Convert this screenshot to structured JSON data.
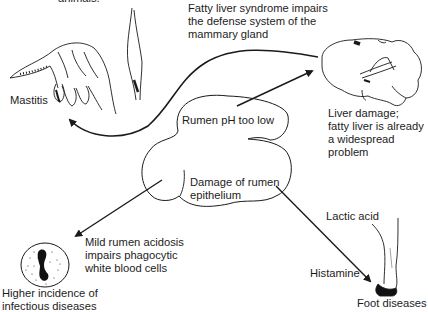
{
  "diagram": {
    "type": "flow",
    "colors": {
      "ink": "#1a1a1a",
      "background": "#ffffff"
    },
    "top_clipped_text": "animals.",
    "nodes": {
      "center": {
        "line1": "Rumen pH too low",
        "line2": "Damage of rumen\nepithelium"
      },
      "mastitis": {
        "label": "Mastitis",
        "icon": "cow-udder-icon"
      },
      "fatty_liver_note": "Fatty liver syndrome impairs\nthe defense system of the\nmammary gland",
      "liver": {
        "label": "Liver damage;\nfatty liver is already\na widespread problem",
        "icon": "liver-icon"
      },
      "infection": {
        "note": "Mild rumen acidosis\nimpairs phagocytic\nwhite blood cells",
        "label": "Higher incidence of\ninfectious diseases",
        "icon": "white-blood-cell-icon"
      },
      "foot": {
        "lactic": "Lactic acid",
        "histamine": "Histamine",
        "label": "Foot diseases",
        "icon": "cow-leg-hoof-icon"
      }
    },
    "edges": [
      {
        "from": "Rumen pH too low",
        "to": "Liver damage"
      },
      {
        "from": "Liver damage",
        "to": "Mastitis",
        "via": "Fatty liver syndrome"
      },
      {
        "from": "Damage of rumen epithelium",
        "to": "Higher incidence of infectious diseases"
      },
      {
        "from": "Damage of rumen epithelium",
        "to": "Foot diseases"
      }
    ]
  }
}
